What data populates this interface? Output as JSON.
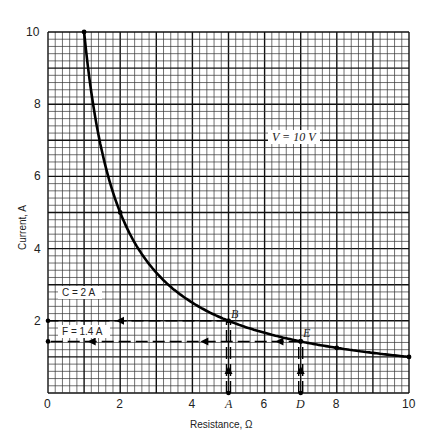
{
  "chart_data": {
    "type": "line",
    "title": "",
    "xlabel": "Resistance, Ω",
    "ylabel": "Current, A",
    "xlim": [
      0,
      10
    ],
    "ylim": [
      0,
      10
    ],
    "grid": true,
    "x_ticks": [
      "0",
      "2",
      "4",
      "6",
      "8",
      "10"
    ],
    "y_ticks": [
      "2",
      "4",
      "6",
      "8",
      "10"
    ],
    "series": [
      {
        "name": "V = 10 V",
        "x": [
          1,
          1.25,
          1.5,
          2,
          2.5,
          3,
          4,
          5,
          6,
          7,
          8,
          9,
          10
        ],
        "y": [
          10,
          8,
          6.67,
          5,
          4,
          3.33,
          2.5,
          2,
          1.67,
          1.43,
          1.25,
          1.11,
          1
        ]
      }
    ],
    "annotations": [
      {
        "label": "V = 10 V",
        "x": 6.5,
        "y": 7.2
      },
      {
        "label": "B",
        "x": 5,
        "y": 2
      },
      {
        "label": "E",
        "x": 7,
        "y": 1.43
      },
      {
        "label": "A",
        "x": 5,
        "y": 0
      },
      {
        "label": "D",
        "x": 7,
        "y": 0
      },
      {
        "label": "C = 2 A",
        "x": 0,
        "y": 2
      },
      {
        "label": "F = 1.4 A",
        "x": 0,
        "y": 1.4
      }
    ]
  },
  "labels": {
    "xlabel": "Resistance, Ω",
    "ylabel": "Current, A",
    "curve": "V = 10 V",
    "B": "B",
    "E": "E",
    "A": "A",
    "D": "D",
    "C": "C = 2 A",
    "F": "F = 1.4 A",
    "x_ticks": [
      "0",
      "2",
      "4",
      "6",
      "8",
      "10"
    ],
    "y_ticks": [
      "2",
      "4",
      "6",
      "8",
      "10"
    ]
  }
}
